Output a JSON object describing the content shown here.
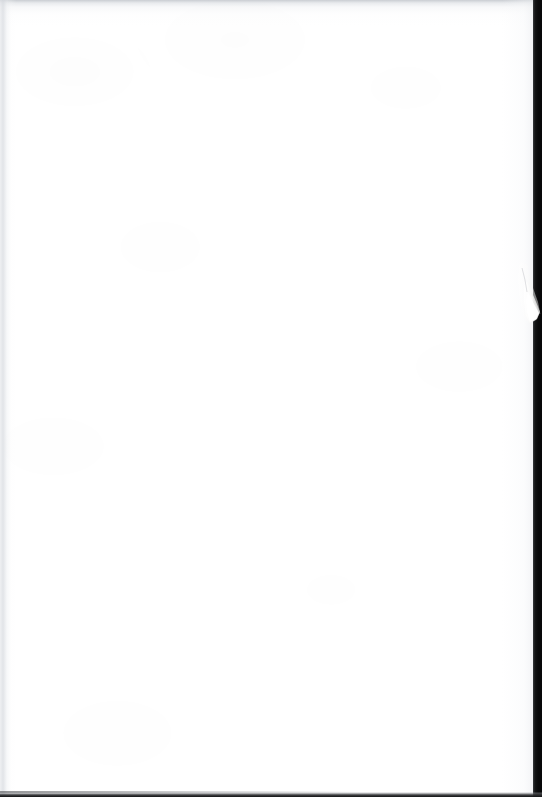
{
  "document": {
    "type": "scanned-page-image",
    "page_content_text": "",
    "is_blank": true,
    "width_px": 542,
    "height_px": 797
  },
  "page": {
    "name": "blank-scanned-leaf",
    "background_color": "#ffffff",
    "sheet_width_px": 534,
    "sheet_height_px": 797
  },
  "artifacts": {
    "top_shadow": {
      "name": "top-edge-scan-shadow",
      "color": "#bec2c8",
      "height_px": 26
    },
    "left_shadow": {
      "name": "left-edge-scan-shadow",
      "color": "#d8dbe0",
      "width_px": 16
    },
    "right_gutter": {
      "name": "right-gutter-dark-strip",
      "color": "#0a0a0b",
      "start_x_px": 533,
      "width_px": 9
    },
    "bottom_edge": {
      "name": "bottom-edge-dark-line",
      "color": "#121314",
      "height_px": 5
    },
    "thumb": {
      "name": "thumb-holding-page",
      "color": "#f2f2f1",
      "shadow_color": "#b9bcc0",
      "x_px": 514,
      "y_px": 262,
      "width_px": 28,
      "height_px": 72
    }
  },
  "caption": {
    "alt_text": "Blank white scanned page with a thumb holding the right edge"
  }
}
